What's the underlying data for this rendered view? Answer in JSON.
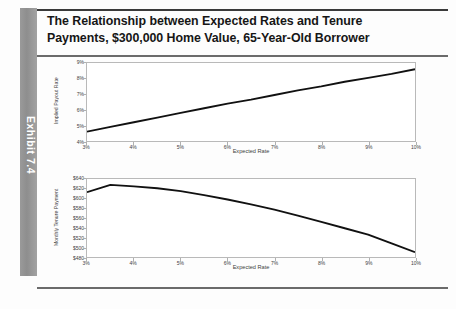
{
  "exhibit": {
    "tab_label": "Exhibit 7.4"
  },
  "title": {
    "line1": "The Relationship between Expected Rates and Tenure",
    "line2": "Payments, $300,000 Home Value, 65-Year-Old Borrower"
  },
  "colors": {
    "tab_gray": "#9a9a9a",
    "line": "#111111",
    "axis": "#b9b9b9",
    "text": "#3d3d3d"
  },
  "chart_data": [
    {
      "id": "implied-payout-rate",
      "type": "line",
      "title": "",
      "xlabel": "Expected Rate",
      "ylabel": "Implied Payout Rate",
      "xlim": [
        3,
        10
      ],
      "ylim": [
        4,
        9
      ],
      "xticks": [
        "3%",
        "4%",
        "5%",
        "6%",
        "7%",
        "8%",
        "9%",
        "10%"
      ],
      "xtick_values": [
        3,
        4,
        5,
        6,
        7,
        8,
        9,
        10
      ],
      "yticks": [
        "4%",
        "5%",
        "6%",
        "7%",
        "8%",
        "9%"
      ],
      "ytick_values": [
        4,
        5,
        6,
        7,
        8,
        9
      ],
      "grid": false,
      "legend": "none",
      "series": [
        {
          "name": "Implied Payout Rate",
          "x": [
            3,
            3.5,
            4,
            4.5,
            5,
            5.5,
            6,
            6.5,
            7,
            7.5,
            8,
            8.5,
            9,
            9.5,
            10
          ],
          "values": [
            4.6,
            4.9,
            5.2,
            5.5,
            5.8,
            6.1,
            6.4,
            6.65,
            6.95,
            7.25,
            7.5,
            7.8,
            8.05,
            8.3,
            8.6
          ]
        }
      ]
    },
    {
      "id": "monthly-tenure-payment",
      "type": "line",
      "title": "",
      "xlabel": "Expected Rate",
      "ylabel": "Monthly Tenure Payment",
      "xlim": [
        3,
        10
      ],
      "ylim": [
        480,
        640
      ],
      "xticks": [
        "3%",
        "4%",
        "5%",
        "6%",
        "7%",
        "8%",
        "9%",
        "10%"
      ],
      "xtick_values": [
        3,
        4,
        5,
        6,
        7,
        8,
        9,
        10
      ],
      "yticks": [
        "$480",
        "$500",
        "$520",
        "$540",
        "$560",
        "$580",
        "$600",
        "$620",
        "$640"
      ],
      "ytick_values": [
        480,
        500,
        520,
        540,
        560,
        580,
        600,
        620,
        640
      ],
      "grid": false,
      "legend": "none",
      "series": [
        {
          "name": "Monthly Tenure Payment",
          "x": [
            3,
            3.5,
            4,
            4.5,
            5,
            5.5,
            6,
            6.5,
            7,
            7.5,
            8,
            8.5,
            9,
            9.5,
            10
          ],
          "values": [
            613,
            628,
            625,
            621,
            615,
            607,
            598,
            588,
            577,
            565,
            552,
            539,
            526,
            508,
            490
          ]
        }
      ]
    }
  ]
}
